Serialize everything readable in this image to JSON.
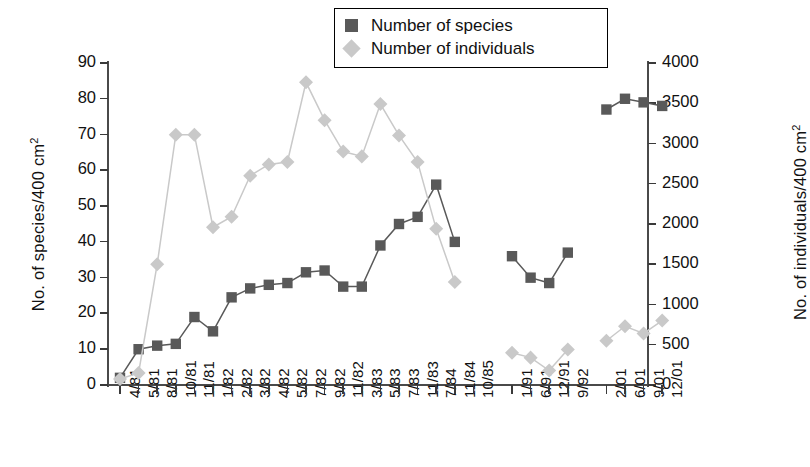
{
  "chart_data": {
    "type": "line",
    "title": "",
    "xlabel": "",
    "grid": false,
    "legend_position": "top-center",
    "categories": [
      "4/81",
      "5/81",
      "8/81",
      "10/81",
      "11/81",
      "1/82",
      "2/82",
      "3/82",
      "4/82",
      "5/82",
      "7/82",
      "9/82",
      "11/82",
      "3/83",
      "5/83",
      "7/83",
      "11/83",
      "7/84",
      "11/84",
      "10/85",
      "1/91",
      "6/91",
      "12/91",
      "9/92",
      "2/01",
      "6/01",
      "9/01",
      "12/01"
    ],
    "group_breaks": [
      20,
      24
    ],
    "axes": {
      "left": {
        "label": "No. of species/400 cm",
        "label_sup": "2",
        "ylim": [
          0,
          90
        ],
        "ticks": [
          0,
          10,
          20,
          30,
          40,
          50,
          60,
          70,
          80,
          90
        ],
        "tick_labels": [
          "0",
          "10",
          "20",
          "30",
          "40",
          "50",
          "60",
          "70",
          "80",
          "90"
        ]
      },
      "right": {
        "label": "No. of individuals/400 cm",
        "label_sup": "2",
        "ylim": [
          0,
          4000
        ],
        "ticks": [
          0,
          500,
          1000,
          1500,
          2000,
          2500,
          3000,
          3500,
          4000
        ],
        "tick_labels": [
          "0",
          "500",
          "1000",
          "1500",
          "2000",
          "2500",
          "3000",
          "3500",
          "4000"
        ]
      }
    },
    "series": [
      {
        "name": "Number of species",
        "legend_label": "Number of species",
        "axis": "left",
        "color": "#595959",
        "marker": "square",
        "values": [
          2,
          10,
          11,
          11.5,
          19,
          15,
          24.5,
          27,
          28,
          28.5,
          31.5,
          32,
          27.5,
          27.5,
          39,
          45,
          47,
          56,
          40,
          null,
          36,
          30,
          28.5,
          37,
          77,
          80,
          79,
          78
        ]
      },
      {
        "name": "Number of individuals",
        "legend_label": "Number of individuals",
        "axis": "right",
        "color": "#c9c9c9",
        "marker": "diamond",
        "values": [
          75,
          150,
          1500,
          3110,
          3110,
          1960,
          2090,
          2600,
          2740,
          2770,
          3760,
          3290,
          2900,
          2840,
          3490,
          3100,
          2770,
          1940,
          1280,
          null,
          400,
          340,
          180,
          440,
          550,
          730,
          640,
          800
        ]
      }
    ]
  }
}
